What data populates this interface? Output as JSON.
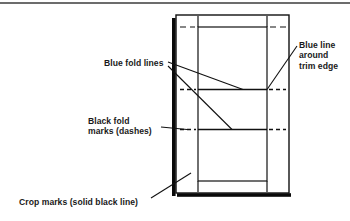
{
  "figure": {
    "kind": "prepress-marks-diagram",
    "width": 350,
    "height": 221,
    "background_color": "#ffffff",
    "top_rule": {
      "name": "top-divider-rule",
      "y": 3,
      "x1": 0,
      "x2": 350,
      "color": "#3b3b3b",
      "thickness": 1.6
    },
    "labels": {
      "blue_fold_lines": "Blue fold lines",
      "blue_trim_edge_line1": "Blue line",
      "blue_trim_edge_line2": "around",
      "blue_trim_edge_line3": "trim edge",
      "black_fold_marks_line1": "Black fold",
      "black_fold_marks_line2": "marks (dashes)",
      "crop_marks": "Crop marks (solid black line)"
    },
    "colors": {
      "line_black": "#111111",
      "shadow_black": "#0a0a0a",
      "text": "#1a1a1a",
      "rule_gray": "#3b3b3b"
    },
    "artboard": {
      "name": "crop-rectangle",
      "left": 176,
      "top": 15,
      "right": 289,
      "bottom": 193,
      "stroke_width": 1.4
    },
    "trim_box": {
      "name": "trim-rectangle",
      "left": 198,
      "top": 27,
      "right": 267,
      "bottom": 181,
      "stroke_width": 1.2
    },
    "shadow_bars": {
      "left_bar": {
        "x": 173.5,
        "y_top": 18,
        "y_bottom": 196,
        "width": 3.2
      },
      "bottom_bar": {
        "x_left": 177,
        "x_right": 291,
        "y": 194.5,
        "height": 3.2
      }
    },
    "fold_lines": {
      "description": "horizontal blue fold lines crossing the trim box",
      "y_values": [
        89.5,
        129.5
      ]
    },
    "fold_dash_marks": {
      "description": "black dashed fold marks outside the trim box",
      "y_values": [
        89.5,
        129.5
      ],
      "left_span": [
        180,
        196
      ],
      "right_span": [
        269,
        286
      ],
      "dash_pattern": "4 3"
    },
    "corner_crop_marks": {
      "description": "short vertical crop mark segments at trim box corners",
      "x_values": [
        198,
        267
      ],
      "top_span": [
        17,
        27
      ],
      "bottom_span": [
        181,
        191
      ]
    },
    "edge_crop_ticks": {
      "description": "short horizontal crop tick segments at trim box top corners",
      "y_values": [
        27
      ],
      "left_span": [
        180,
        196
      ],
      "right_span": [
        269,
        286
      ]
    },
    "leaders": [
      {
        "name": "leader-blue-fold-lines-upper",
        "from": [
          168,
          62
        ],
        "to": [
          243,
          89.5
        ]
      },
      {
        "name": "leader-blue-fold-lines-lower",
        "from": [
          168,
          66
        ],
        "to": [
          232,
          129.5
        ]
      },
      {
        "name": "leader-blue-trim-edge",
        "from": [
          296,
          46
        ],
        "to": [
          267,
          89.5
        ]
      },
      {
        "name": "leader-black-fold-marks",
        "from": [
          162,
          126
        ],
        "to": [
          187,
          129.5
        ]
      },
      {
        "name": "leader-crop-marks",
        "from": [
          152,
          198
        ],
        "to": [
          190,
          174
        ]
      }
    ]
  }
}
